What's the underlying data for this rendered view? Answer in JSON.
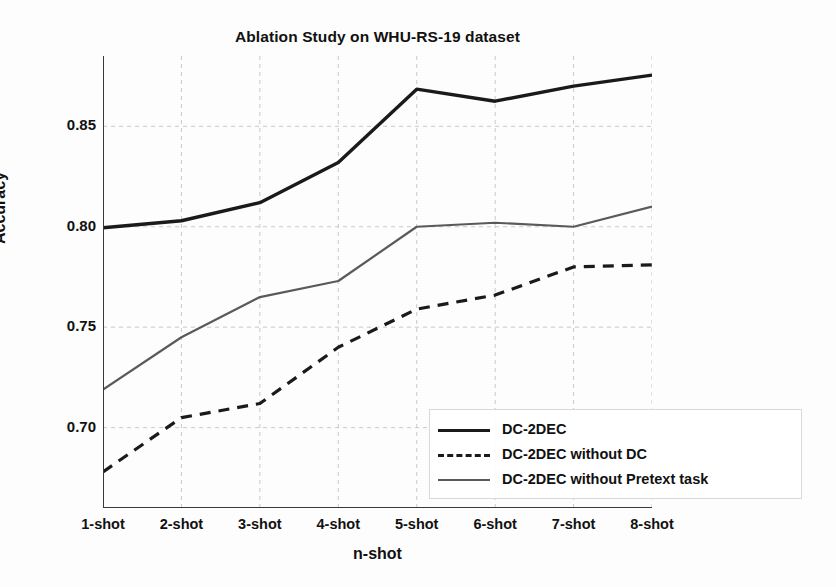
{
  "chart_data": {
    "type": "line",
    "title": "Ablation Study on WHU-RS-19 dataset",
    "xlabel": "n-shot",
    "ylabel": "Accuracy",
    "categories": [
      "1-shot",
      "2-shot",
      "3-shot",
      "4-shot",
      "5-shot",
      "6-shot",
      "7-shot",
      "8-shot"
    ],
    "ylim": [
      0.66,
      0.885
    ],
    "yticks": [
      0.7,
      0.75,
      0.8,
      0.85
    ],
    "ytick_labels": [
      "0.70",
      "0.75",
      "0.80",
      "0.85"
    ],
    "grid": true,
    "grid_style": "dashed",
    "legend_position": "lower right",
    "series": [
      {
        "name": "DC-2DEC",
        "style": "solid",
        "color": "#1a1a1a",
        "width": 3.4,
        "values": [
          0.7995,
          0.803,
          0.812,
          0.832,
          0.8685,
          0.8625,
          0.87,
          0.8755
        ]
      },
      {
        "name": "DC-2DEC without DC",
        "style": "dashed",
        "color": "#1a1a1a",
        "width": 3.2,
        "values": [
          0.678,
          0.705,
          0.712,
          0.74,
          0.759,
          0.766,
          0.78,
          0.781
        ]
      },
      {
        "name": "DC-2DEC without Pretext task",
        "style": "solid",
        "color": "#5a5a5a",
        "width": 2.2,
        "values": [
          0.719,
          0.745,
          0.765,
          0.773,
          0.8,
          0.802,
          0.8,
          0.81
        ]
      }
    ]
  },
  "legend": {
    "items": [
      {
        "label": "DC-2DEC"
      },
      {
        "label": "DC-2DEC without DC"
      },
      {
        "label": "DC-2DEC without Pretext task"
      }
    ]
  }
}
